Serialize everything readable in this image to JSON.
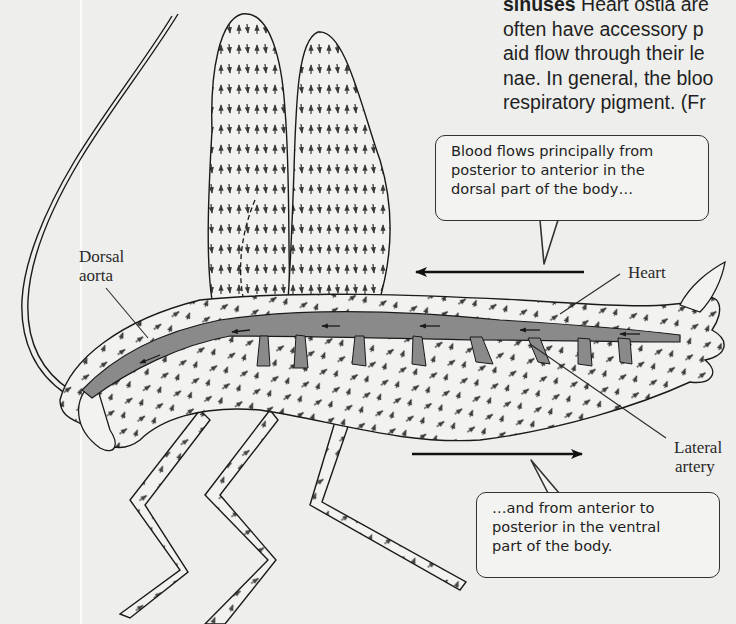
{
  "body_text": {
    "lines": [
      {
        "bold": "sinuses",
        "text": " Heart ostia are"
      },
      {
        "bold": "",
        "text": "often have accessory p"
      },
      {
        "bold": "",
        "text": "aid flow through their le"
      },
      {
        "bold": "",
        "text": "nae. In general, the bloo"
      },
      {
        "bold": "",
        "text": "respiratory pigment. (Fr"
      }
    ]
  },
  "figure": {
    "colors": {
      "background": "#eeeeec",
      "outline": "#1a1a1a",
      "heart_vessel": "#8a8a8a",
      "body_fill": "#f0f0ee"
    },
    "labels": {
      "dorsal_aorta_line1": "Dorsal",
      "dorsal_aorta_line2": "aorta",
      "heart": "Heart",
      "lateral_artery_line1": "Lateral",
      "lateral_artery_line2": "artery"
    },
    "callouts": {
      "dorsal": {
        "lines": [
          "Blood flows principally from",
          "posterior to anterior in the",
          "dorsal part of the body…"
        ]
      },
      "ventral": {
        "lines": [
          "…and from anterior to",
          "posterior in the ventral",
          "part of the body."
        ]
      }
    },
    "flow_arrows": {
      "dorsal": {
        "direction": "left",
        "meaning": "posterior to anterior"
      },
      "ventral": {
        "direction": "right",
        "meaning": "anterior to posterior"
      }
    }
  }
}
